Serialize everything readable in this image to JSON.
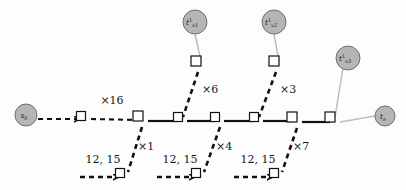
{
  "diagram": {
    "background_color": "#fdfdfd",
    "colors": {
      "spine": "#111111",
      "dashed": "#111111",
      "gray_link": "#b9b9b9",
      "circle_fill": "#b5b5b5",
      "circle_stroke": "#6f6f6f",
      "square_fill": "#ffffff",
      "square_stroke": "#111111",
      "text": "#1a1a1a"
    },
    "circle_nodes": [
      {
        "id": "source",
        "label_base": "s",
        "label_sub": "0",
        "label_sup": "",
        "cx": 26,
        "cy": 115,
        "r": 11
      },
      {
        "id": "sink",
        "label_base": "t",
        "label_sub": "e",
        "label_sup": "",
        "cx": 385,
        "cy": 116,
        "r": 10
      },
      {
        "id": "branch-top-1",
        "label_base": "t",
        "label_sub": "v1",
        "label_sup": "1",
        "cx": 195,
        "cy": 22,
        "r": 12
      },
      {
        "id": "branch-top-2",
        "label_base": "t",
        "label_sub": "v2",
        "label_sup": "1",
        "cx": 274,
        "cy": 22,
        "r": 12
      },
      {
        "id": "branch-top-3",
        "label_base": "t",
        "label_sub": "v3",
        "label_sup": "1",
        "cx": 348,
        "cy": 58,
        "r": 12
      }
    ],
    "square_nodes": [
      {
        "id": "sq-entry",
        "x": 81,
        "y": 116,
        "size": 9
      },
      {
        "id": "sq-spine-1",
        "x": 138,
        "y": 116,
        "size": 10
      },
      {
        "id": "sq-spine-2",
        "x": 178,
        "y": 117,
        "size": 9
      },
      {
        "id": "sq-spine-3",
        "x": 215,
        "y": 117,
        "size": 9
      },
      {
        "id": "sq-spine-4",
        "x": 254,
        "y": 117,
        "size": 9
      },
      {
        "id": "sq-spine-5",
        "x": 292,
        "y": 117,
        "size": 10
      },
      {
        "id": "sq-spine-6",
        "x": 330,
        "y": 117,
        "size": 10
      },
      {
        "id": "sq-top-1",
        "x": 196,
        "y": 61,
        "size": 10
      },
      {
        "id": "sq-top-2",
        "x": 274,
        "y": 61,
        "size": 10
      },
      {
        "id": "sq-bottom-1",
        "x": 120,
        "y": 173,
        "size": 9
      },
      {
        "id": "sq-bottom-2",
        "x": 196,
        "y": 173,
        "size": 9
      },
      {
        "id": "sq-bottom-3",
        "x": 274,
        "y": 173,
        "size": 9
      }
    ],
    "edge_labels": [
      {
        "id": "label-x16",
        "text": "×16",
        "x": 112,
        "y": 104,
        "anchor": "middle"
      },
      {
        "id": "label-x6",
        "text": "×6",
        "x": 202,
        "y": 93,
        "anchor": "start"
      },
      {
        "id": "label-x3",
        "text": "×3",
        "x": 280,
        "y": 93,
        "anchor": "start"
      },
      {
        "id": "label-x1",
        "text": "×1",
        "x": 138,
        "y": 150,
        "anchor": "start"
      },
      {
        "id": "label-x4",
        "text": "×4",
        "x": 216,
        "y": 150,
        "anchor": "start"
      },
      {
        "id": "label-x7",
        "text": "×7",
        "x": 293,
        "y": 150,
        "anchor": "start"
      },
      {
        "id": "label-cost-1",
        "text": "12, 15",
        "x": 103,
        "y": 163,
        "anchor": "middle"
      },
      {
        "id": "label-cost-2",
        "text": "12, 15",
        "x": 180,
        "y": 163,
        "anchor": "middle"
      },
      {
        "id": "label-cost-3",
        "text": "12, 15",
        "x": 258,
        "y": 163,
        "anchor": "middle"
      }
    ]
  }
}
